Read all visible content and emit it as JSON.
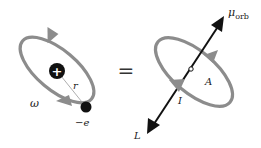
{
  "diagram": {
    "left_panel": {
      "nucleus_symbol": "+",
      "radius_label": "r",
      "angular_velocity_label": "ω",
      "electron_label": "−e"
    },
    "equals_sign": "=",
    "right_panel": {
      "magnetic_moment_label": "μ",
      "magnetic_moment_subscript": "orb",
      "area_label": "A",
      "current_label": "I",
      "angular_momentum_label": "L"
    },
    "colors": {
      "orbit": "#8c8c8c",
      "nucleus": "#111111",
      "electron": "#111111",
      "vector_arrow": "#111111",
      "background": "#ffffff"
    }
  }
}
